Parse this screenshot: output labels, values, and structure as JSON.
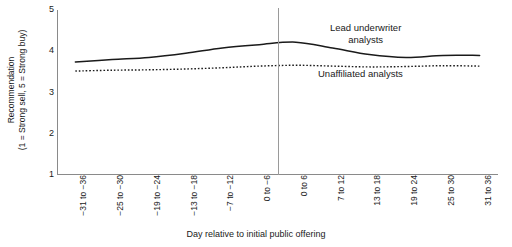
{
  "chart_data": {
    "type": "line",
    "title": "",
    "xlabel": "Day relative to initial public offering",
    "ylabel": "Recommendation (1 = Strong sell, 5 = Strong buy)",
    "ylabel_line1": "Recommendation",
    "ylabel_line2": "(1 = Strong sell, 5 = Strong buy)",
    "categories": [
      "−31 to −36",
      "−25 to −30",
      "−19 to −24",
      "−13 to −18",
      "−7 to −12",
      "0 to −6",
      "0 to 6",
      "7 to 12",
      "13 to 18",
      "19 to 24",
      "25 to 30",
      "31 to 36"
    ],
    "yticks": [
      5,
      4,
      3,
      2,
      1
    ],
    "ylim": [
      1,
      5
    ],
    "grid": false,
    "legend_position": "inline-annotation",
    "annotations": [
      {
        "text": "Lead underwriter analysts",
        "series": "Lead underwriter analysts"
      },
      {
        "text": "Unaffiliated analysts",
        "series": "Unaffiliated analysts"
      }
    ],
    "vertical_reference_line": {
      "label": "IPO date",
      "between_categories": [
        "0 to −6",
        "0 to 6"
      ]
    },
    "series": [
      {
        "name": "Lead underwriter analysts",
        "style": "solid",
        "color": "#1a1a1a",
        "values": [
          3.74,
          3.8,
          3.85,
          3.95,
          4.08,
          4.16,
          4.22,
          4.08,
          3.92,
          3.85,
          3.9,
          3.9
        ]
      },
      {
        "name": "Unaffiliated analysts",
        "style": "dotted",
        "color": "#1a1a1a",
        "values": [
          3.52,
          3.54,
          3.55,
          3.57,
          3.6,
          3.64,
          3.66,
          3.64,
          3.62,
          3.63,
          3.65,
          3.64
        ]
      }
    ]
  },
  "annotations": {
    "lead_label_line1": "Lead underwriter",
    "lead_label_line2": "analysts",
    "unaffiliated_label": "Unaffiliated analysts"
  }
}
